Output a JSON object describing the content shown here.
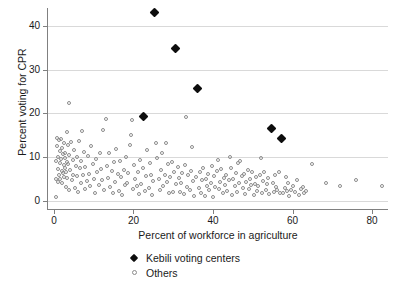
{
  "chart_data": {
    "type": "scatter",
    "title": "",
    "xlabel": "Percent of workforce in agriculture",
    "ylabel": "Percent voting for CPR",
    "xlim": [
      -1.5,
      84
    ],
    "ylim": [
      -1.5,
      44
    ],
    "xticks": [
      0,
      20,
      40,
      60,
      80
    ],
    "yticks": [
      0,
      10,
      20,
      30,
      40
    ],
    "xticklabels": [
      "0",
      "20",
      "40",
      "60",
      "80"
    ],
    "yticklabels": [
      "0",
      "10",
      "20",
      "30",
      "40"
    ],
    "grid": "horizontal",
    "legend_position": "below-axes-center",
    "series": [
      {
        "name": "Kebili voting centers",
        "marker": "filled-diamond",
        "color": "#0d0d0d",
        "points": [
          [
            25.4,
            43.0
          ],
          [
            30.5,
            34.9
          ],
          [
            36.0,
            25.8
          ],
          [
            22.6,
            19.4
          ],
          [
            54.6,
            16.6
          ],
          [
            57.2,
            14.2
          ]
        ]
      },
      {
        "name": "Others",
        "marker": "open-circle",
        "color": "#8c8c8c",
        "points": [
          [
            0.4,
            1.0
          ],
          [
            0.5,
            5.2
          ],
          [
            0.6,
            9.1
          ],
          [
            0.7,
            12.6
          ],
          [
            0.8,
            14.4
          ],
          [
            0.9,
            7.3
          ],
          [
            1.0,
            4.4
          ],
          [
            1.1,
            10.2
          ],
          [
            1.2,
            13.9
          ],
          [
            1.3,
            6.1
          ],
          [
            1.4,
            8.8
          ],
          [
            1.5,
            11.5
          ],
          [
            1.6,
            5.0
          ],
          [
            1.7,
            14.2
          ],
          [
            1.8,
            9.6
          ],
          [
            1.9,
            7.0
          ],
          [
            2.0,
            12.1
          ],
          [
            2.1,
            4.1
          ],
          [
            2.2,
            10.8
          ],
          [
            2.3,
            6.4
          ],
          [
            2.4,
            8.2
          ],
          [
            2.5,
            13.2
          ],
          [
            2.6,
            5.6
          ],
          [
            2.7,
            9.9
          ],
          [
            2.8,
            11.0
          ],
          [
            2.9,
            7.7
          ],
          [
            3.0,
            3.3
          ],
          [
            3.1,
            6.8
          ],
          [
            3.2,
            15.7
          ],
          [
            3.3,
            9.0
          ],
          [
            3.4,
            5.3
          ],
          [
            3.5,
            12.9
          ],
          [
            3.6,
            8.4
          ],
          [
            3.7,
            2.5
          ],
          [
            3.8,
            10.5
          ],
          [
            3.9,
            22.3
          ],
          [
            4.1,
            7.2
          ],
          [
            4.3,
            13.6
          ],
          [
            4.5,
            4.8
          ],
          [
            4.7,
            9.4
          ],
          [
            4.9,
            6.0
          ],
          [
            5.1,
            11.8
          ],
          [
            5.3,
            3.0
          ],
          [
            5.5,
            8.0
          ],
          [
            5.7,
            5.7
          ],
          [
            5.9,
            10.0
          ],
          [
            6.1,
            2.2
          ],
          [
            6.3,
            13.8
          ],
          [
            6.5,
            7.5
          ],
          [
            6.7,
            4.3
          ],
          [
            6.9,
            9.2
          ],
          [
            7.1,
            16.0
          ],
          [
            7.3,
            5.9
          ],
          [
            7.5,
            11.3
          ],
          [
            7.7,
            2.8
          ],
          [
            7.9,
            7.9
          ],
          [
            8.2,
            4.6
          ],
          [
            8.5,
            10.4
          ],
          [
            8.8,
            6.3
          ],
          [
            9.1,
            3.5
          ],
          [
            9.4,
            12.5
          ],
          [
            9.7,
            8.6
          ],
          [
            10.0,
            5.1
          ],
          [
            10.3,
            2.0
          ],
          [
            10.6,
            9.7
          ],
          [
            10.9,
            6.6
          ],
          [
            11.2,
            3.8
          ],
          [
            11.5,
            11.1
          ],
          [
            11.8,
            7.4
          ],
          [
            12.1,
            4.9
          ],
          [
            12.4,
            16.2
          ],
          [
            12.7,
            2.6
          ],
          [
            13.0,
            18.8
          ],
          [
            13.3,
            8.1
          ],
          [
            13.6,
            5.4
          ],
          [
            13.9,
            10.9
          ],
          [
            14.2,
            3.2
          ],
          [
            14.5,
            6.9
          ],
          [
            14.8,
            1.9
          ],
          [
            15.1,
            8.9
          ],
          [
            15.4,
            4.5
          ],
          [
            15.7,
            12.0
          ],
          [
            16.0,
            6.2
          ],
          [
            16.3,
            2.3
          ],
          [
            16.6,
            9.3
          ],
          [
            16.9,
            5.5
          ],
          [
            17.2,
            1.4
          ],
          [
            17.5,
            7.1
          ],
          [
            17.8,
            3.7
          ],
          [
            18.1,
            10.1
          ],
          [
            18.4,
            4.2
          ],
          [
            18.7,
            6.5
          ],
          [
            19.0,
            12.8
          ],
          [
            19.3,
            15.2
          ],
          [
            19.6,
            18.5
          ],
          [
            19.9,
            2.9
          ],
          [
            20.2,
            8.3
          ],
          [
            20.5,
            5.0
          ],
          [
            20.8,
            3.4
          ],
          [
            21.1,
            6.7
          ],
          [
            21.4,
            1.7
          ],
          [
            21.7,
            9.5
          ],
          [
            22.0,
            4.0
          ],
          [
            22.3,
            7.6
          ],
          [
            22.9,
            2.4
          ],
          [
            23.2,
            5.8
          ],
          [
            23.5,
            11.6
          ],
          [
            23.8,
            3.1
          ],
          [
            24.1,
            8.7
          ],
          [
            24.4,
            6.1
          ],
          [
            24.7,
            1.5
          ],
          [
            25.0,
            4.7
          ],
          [
            25.7,
            13.2
          ],
          [
            26.0,
            9.8
          ],
          [
            26.3,
            5.2
          ],
          [
            26.6,
            2.7
          ],
          [
            26.9,
            7.2
          ],
          [
            27.2,
            11.0
          ],
          [
            27.5,
            3.6
          ],
          [
            27.8,
            6.0
          ],
          [
            28.1,
            13.4
          ],
          [
            28.4,
            4.4
          ],
          [
            28.7,
            8.5
          ],
          [
            29.0,
            1.8
          ],
          [
            29.3,
            5.6
          ],
          [
            29.6,
            9.0
          ],
          [
            29.9,
            2.1
          ],
          [
            30.2,
            6.8
          ],
          [
            30.8,
            3.9
          ],
          [
            31.1,
            7.8
          ],
          [
            31.4,
            5.3
          ],
          [
            31.7,
            2.2
          ],
          [
            32.0,
            4.1
          ],
          [
            32.3,
            6.4
          ],
          [
            32.6,
            1.6
          ],
          [
            32.9,
            8.2
          ],
          [
            33.2,
            19.3
          ],
          [
            33.5,
            3.3
          ],
          [
            33.8,
            5.9
          ],
          [
            34.1,
            2.5
          ],
          [
            34.4,
            7.0
          ],
          [
            34.7,
            12.4
          ],
          [
            35.0,
            4.6
          ],
          [
            35.3,
            1.2
          ],
          [
            35.6,
            5.5
          ],
          [
            36.4,
            3.0
          ],
          [
            36.7,
            6.6
          ],
          [
            37.0,
            2.0
          ],
          [
            37.3,
            4.9
          ],
          [
            37.6,
            7.5
          ],
          [
            37.9,
            1.3
          ],
          [
            38.2,
            5.1
          ],
          [
            38.5,
            3.5
          ],
          [
            38.8,
            6.2
          ],
          [
            39.1,
            2.6
          ],
          [
            39.4,
            4.3
          ],
          [
            39.7,
            8.0
          ],
          [
            40.0,
            1.1
          ],
          [
            40.3,
            5.7
          ],
          [
            40.6,
            3.2
          ],
          [
            40.9,
            6.9
          ],
          [
            41.2,
            9.4
          ],
          [
            41.5,
            2.8
          ],
          [
            41.8,
            4.5
          ],
          [
            42.1,
            7.3
          ],
          [
            42.4,
            1.9
          ],
          [
            42.7,
            5.4
          ],
          [
            43.0,
            3.7
          ],
          [
            43.3,
            6.1
          ],
          [
            43.6,
            2.3
          ],
          [
            43.9,
            4.8
          ],
          [
            44.2,
            10.2
          ],
          [
            44.5,
            7.7
          ],
          [
            44.8,
            1.4
          ],
          [
            45.1,
            5.0
          ],
          [
            45.4,
            3.4
          ],
          [
            45.7,
            6.5
          ],
          [
            46.0,
            2.1
          ],
          [
            46.3,
            8.8
          ],
          [
            46.6,
            4.2
          ],
          [
            46.9,
            9.1
          ],
          [
            47.2,
            5.8
          ],
          [
            47.5,
            3.1
          ],
          [
            47.8,
            6.3
          ],
          [
            48.1,
            1.7
          ],
          [
            48.4,
            4.4
          ],
          [
            48.7,
            7.1
          ],
          [
            49.0,
            2.9
          ],
          [
            49.3,
            5.2
          ],
          [
            49.6,
            3.8
          ],
          [
            49.9,
            6.7
          ],
          [
            50.2,
            1.5
          ],
          [
            50.5,
            4.0
          ],
          [
            50.8,
            5.5
          ],
          [
            51.1,
            2.4
          ],
          [
            51.4,
            3.6
          ],
          [
            51.7,
            6.0
          ],
          [
            52.0,
            9.8
          ],
          [
            52.3,
            1.8
          ],
          [
            52.6,
            4.7
          ],
          [
            52.9,
            6.6
          ],
          [
            53.2,
            2.7
          ],
          [
            53.5,
            3.9
          ],
          [
            53.8,
            5.3
          ],
          [
            54.1,
            1.6
          ],
          [
            55.0,
            4.1
          ],
          [
            55.3,
            2.2
          ],
          [
            55.6,
            5.9
          ],
          [
            55.9,
            3.3
          ],
          [
            56.2,
            2.5
          ],
          [
            56.5,
            6.8
          ],
          [
            56.8,
            1.9
          ],
          [
            57.7,
            2.0
          ],
          [
            58.0,
            3.0
          ],
          [
            58.3,
            5.6
          ],
          [
            58.6,
            2.3
          ],
          [
            58.9,
            4.3
          ],
          [
            59.2,
            1.3
          ],
          [
            59.5,
            2.7
          ],
          [
            60.0,
            3.5
          ],
          [
            60.5,
            2.1
          ],
          [
            61.0,
            4.9
          ],
          [
            61.5,
            1.5
          ],
          [
            62.0,
            2.8
          ],
          [
            62.5,
            3.2
          ],
          [
            63.0,
            1.8
          ],
          [
            63.5,
            2.4
          ],
          [
            64.8,
            8.5
          ],
          [
            68.5,
            4.2
          ],
          [
            72.0,
            3.5
          ],
          [
            76.0,
            4.9
          ],
          [
            82.5,
            3.6
          ]
        ]
      }
    ]
  },
  "legend": {
    "items": [
      {
        "label": "Kebili voting centers",
        "marker": "filled-diamond"
      },
      {
        "label": "Others",
        "marker": "open-circle"
      }
    ]
  }
}
